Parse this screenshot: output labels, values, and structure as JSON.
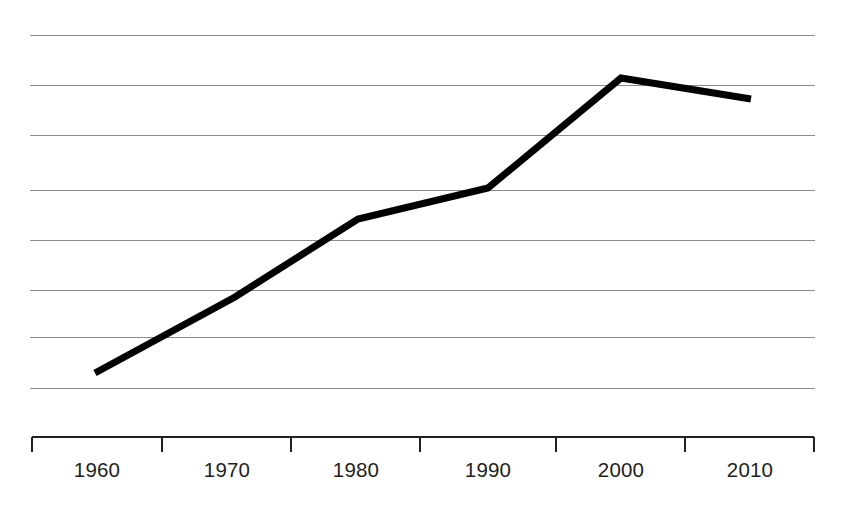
{
  "chart_data": {
    "type": "line",
    "title": "",
    "subtitle": "",
    "xlabel": "",
    "ylabel": "",
    "categories": [
      "1960",
      "1970",
      "1980",
      "1990",
      "2000",
      "2010"
    ],
    "x": [
      1960,
      1970,
      1980,
      1990,
      2000,
      2010
    ],
    "values": [
      1.3,
      2.8,
      4.3,
      4.9,
      7.1,
      6.7
    ],
    "series": [
      {
        "name": "",
        "values": [
          1.3,
          2.8,
          4.3,
          4.9,
          7.1,
          6.7
        ],
        "color": "#000000",
        "line_width": 7
      }
    ],
    "xlim": [
      1955,
      2015
    ],
    "ylim": [
      0,
      8
    ],
    "grid": {
      "horizontal": true,
      "vertical": false,
      "count": 8,
      "color": "#8a8a8a",
      "y_values": [
        8,
        7,
        6,
        5,
        4,
        3,
        2,
        1
      ]
    },
    "axis": {
      "x_axis_visible": true,
      "y_axis_visible": false,
      "y_tick_labels_visible": false,
      "tick_direction": "down",
      "tick_count": 7,
      "axis_color": "#231f20"
    },
    "legend": {
      "visible": false,
      "position": "none",
      "entries": []
    },
    "annotations": []
  },
  "geometry": {
    "plot_left": 30,
    "plot_right": 815,
    "gridline_y": [
      35,
      85,
      135,
      190,
      240,
      290,
      337,
      388
    ],
    "axis_y": 437,
    "tick_x": [
      32,
      162,
      291,
      420,
      556,
      685,
      814
    ],
    "tick_bottom": 452,
    "label_y": 477,
    "label_x": [
      97,
      227,
      356,
      488,
      621,
      750
    ],
    "points": [
      {
        "x": 95,
        "y": 373
      },
      {
        "x": 235,
        "y": 297
      },
      {
        "x": 358,
        "y": 219
      },
      {
        "x": 488,
        "y": 188
      },
      {
        "x": 621,
        "y": 78
      },
      {
        "x": 751,
        "y": 99
      }
    ]
  },
  "colors": {
    "background": "#ffffff",
    "line": "#000000",
    "gridline": "#8a8a8a",
    "axis": "#231f20",
    "label_text": "#231f20"
  }
}
